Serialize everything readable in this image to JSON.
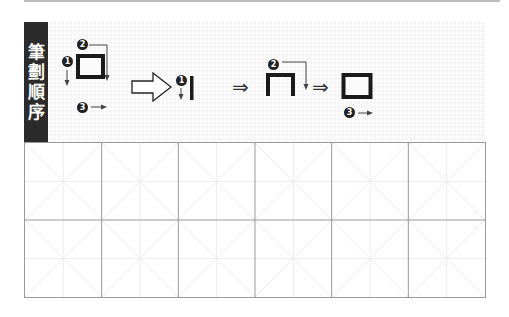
{
  "label": {
    "chars": [
      "筆",
      "劃",
      "順",
      "序"
    ]
  },
  "steps": {
    "full_char": {
      "stroke_numbers": [
        "1",
        "2",
        "3"
      ]
    },
    "step1": {
      "stroke_number": "1"
    },
    "step2": {
      "stroke_number": "2"
    },
    "step3": {
      "stroke_number": "3"
    },
    "then_arrow": "⇒"
  },
  "grid": {
    "rows": 2,
    "cols": 6
  },
  "colors": {
    "label_bg": "#2b2b2b",
    "panel_bg": "#f3f3f3",
    "stroke": "#1a1a1a",
    "grid_line": "#9a9a9a",
    "guide_line": "#e6e6e6"
  }
}
